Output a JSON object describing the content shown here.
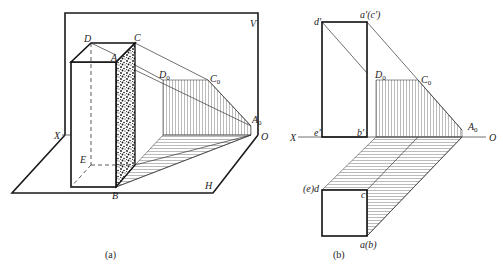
{
  "figure_a": {
    "caption": "(a)",
    "plane_v_label": "V",
    "plane_h_label": "H",
    "axis_x_label": "X",
    "axis_o_label": "O",
    "points": {
      "D": "D",
      "A": "A",
      "C": "C",
      "E": "E",
      "B": "B",
      "D0": "D",
      "C0": "C",
      "A0": "A",
      "sub0": "0"
    }
  },
  "figure_b": {
    "caption": "(b)",
    "axis_x_label": "X",
    "axis_o_label": "O",
    "points": {
      "d_prime": "d'",
      "a_prime_c_prime": "a'(c')",
      "e_prime": "e'",
      "b_prime": "b'",
      "D0": "D",
      "C0": "C",
      "A0": "A",
      "sub0": "0",
      "e_d": "(e)d",
      "c": "c",
      "a_b": "a(b)"
    }
  },
  "colors": {
    "line": "#1a1a1a",
    "background": "#ffffff"
  }
}
